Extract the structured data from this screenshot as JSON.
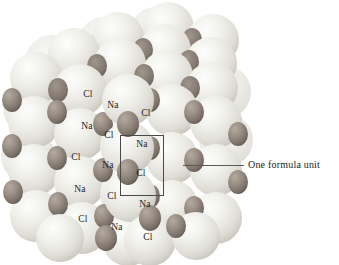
{
  "figure": {
    "name": "sodium-chloride-crystal-lattice",
    "background_color": "#ffffff"
  },
  "crystal": {
    "description": "Space-filling model of the sodium chloride (NaCl) crystal lattice viewed as a cube corner",
    "ion_types": [
      {
        "symbol": "Cl",
        "role": "chloride-ion",
        "relative_size": "large",
        "fill": "#e8e8e4",
        "shade": "#c9c9c2"
      },
      {
        "symbol": "Na",
        "role": "sodium-ion",
        "relative_size": "small",
        "fill": "#9a8f86",
        "shade": "#6f655d"
      }
    ],
    "bounds": {
      "left": 17,
      "top": 15,
      "right": 232,
      "bottom": 253
    },
    "spheres": [
      {
        "cx": 122,
        "cy": 34,
        "r": 25,
        "type": "Cl"
      },
      {
        "cx": 172,
        "cy": 48,
        "r": 25,
        "type": "Cl"
      },
      {
        "cx": 72,
        "cy": 52,
        "r": 25,
        "type": "Cl"
      },
      {
        "cx": 215,
        "cy": 62,
        "r": 25,
        "type": "Cl"
      },
      {
        "cx": 40,
        "cy": 74,
        "r": 25,
        "type": "Cl"
      },
      {
        "cx": 150,
        "cy": 30,
        "r": 9,
        "type": "Na"
      },
      {
        "cx": 99,
        "cy": 48,
        "r": 9,
        "type": "Na"
      },
      {
        "cx": 196,
        "cy": 44,
        "r": 9,
        "type": "Na"
      },
      {
        "cx": 60,
        "cy": 70,
        "r": 9,
        "type": "Na"
      },
      {
        "cx": 147,
        "cy": 62,
        "r": 9,
        "type": "Na"
      }
    ],
    "labels": [
      {
        "text": "Cl",
        "x": 88,
        "y": 95,
        "ion": "Cl"
      },
      {
        "text": "Na",
        "x": 113,
        "y": 106,
        "ion": "Na"
      },
      {
        "text": "Cl",
        "x": 146,
        "y": 114,
        "ion": "Cl"
      },
      {
        "text": "Na",
        "x": 87,
        "y": 127,
        "ion": "Na"
      },
      {
        "text": "Cl",
        "x": 109,
        "y": 136,
        "ion": "Cl"
      },
      {
        "text": "Na",
        "x": 142,
        "y": 145,
        "ion": "Na"
      },
      {
        "text": "Cl",
        "x": 76,
        "y": 158,
        "ion": "Cl"
      },
      {
        "text": "Na",
        "x": 108,
        "y": 166,
        "ion": "Na"
      },
      {
        "text": "Cl",
        "x": 141,
        "y": 174,
        "ion": "Cl"
      },
      {
        "text": "Na",
        "x": 80,
        "y": 190,
        "ion": "Na"
      },
      {
        "text": "Cl",
        "x": 112,
        "y": 197,
        "ion": "Cl"
      },
      {
        "text": "Na",
        "x": 145,
        "y": 205,
        "ion": "Na"
      },
      {
        "text": "Cl",
        "x": 83,
        "y": 220,
        "ion": "Cl"
      },
      {
        "text": "Na",
        "x": 117,
        "y": 228,
        "ion": "Na"
      },
      {
        "text": "Cl",
        "x": 148,
        "y": 238,
        "ion": "Cl"
      }
    ]
  },
  "unit_cell": {
    "label": "One formula unit",
    "box": {
      "left": 120,
      "top": 135,
      "width": 44,
      "height": 61
    },
    "leader": {
      "x1": 183,
      "y1": 165,
      "x2": 244,
      "y2": 165
    },
    "text_position": {
      "x": 248,
      "y": 159
    },
    "line_color": "#4a4a4a"
  }
}
